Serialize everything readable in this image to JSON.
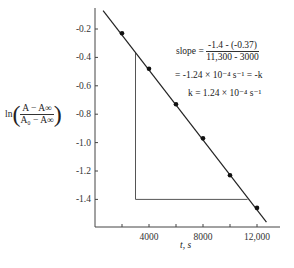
{
  "chart_data": {
    "type": "scatter",
    "title": "",
    "xlabel": "t, s",
    "ylabel": "ln((A - A∞)/(A0 - A∞))",
    "xlim": [
      0,
      13500
    ],
    "ylim": [
      -1.6,
      -0.06
    ],
    "xticks": [
      2000,
      4000,
      6000,
      8000,
      10000,
      12000
    ],
    "xtick_labels": [
      "",
      "4000",
      "",
      "8000",
      "",
      "12,000"
    ],
    "yticks": [
      -0.2,
      -0.4,
      -0.6,
      -0.8,
      -1.0,
      -1.2,
      -1.4
    ],
    "ytick_labels": [
      "-0.2",
      "-0.4",
      "-0.6",
      "-0.8",
      "-1.0",
      "-1.2",
      "-1.4"
    ],
    "grid": false,
    "series": [
      {
        "name": "data",
        "x": [
          2000,
          4000,
          6000,
          8000,
          10000,
          12000
        ],
        "y": [
          -0.23,
          -0.48,
          -0.73,
          -0.97,
          -1.23,
          -1.46
        ]
      }
    ],
    "fit_line": {
      "x": [
        600,
        12700
      ],
      "y": [
        -0.07,
        -1.56
      ]
    },
    "slope_triangle": {
      "x1": 3000,
      "y1": -0.37,
      "x2": 11300,
      "y2": -1.4
    },
    "annotations": {
      "slope_label": "slope =",
      "slope_num": "-1.4 - (-0.37)",
      "slope_den": "11,300 - 3000",
      "line2": "= -1.24 × 10⁻⁴  s⁻¹ = -k",
      "line3": "k = 1.24 × 10⁻⁴  s⁻¹"
    }
  },
  "labels": {
    "ylabel_ln": "ln",
    "ylabel_num": "A − A∞",
    "ylabel_den": "A₀ − A∞",
    "xlabel": "t, s"
  }
}
